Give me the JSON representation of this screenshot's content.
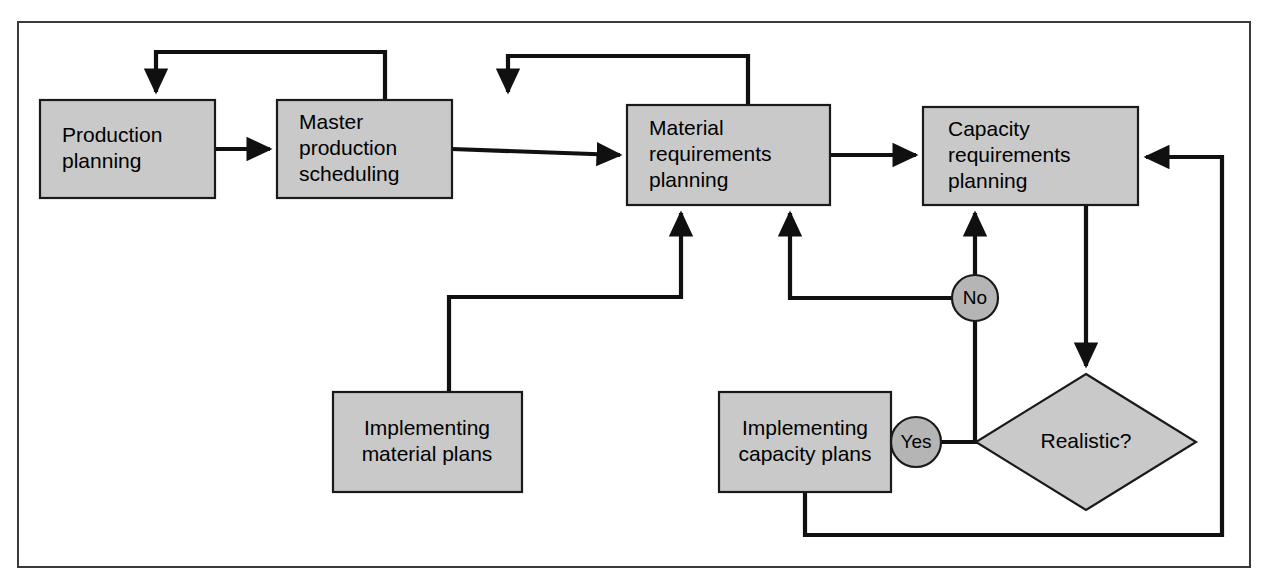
{
  "figure": {
    "frame": {
      "x": 18,
      "y": 22,
      "width": 1232,
      "height": 545
    },
    "colors": {
      "box_fill": "#c9c9c9",
      "connector_fill": "#b5b5b5",
      "line": "#101010",
      "box_stroke": "#1a1a1a",
      "frame_stroke": "#3a3a3a",
      "background": "#ffffff",
      "text": "#000000"
    }
  },
  "nodes": [
    {
      "id": "production-planning",
      "shape": "rect",
      "x": 40,
      "y": 100,
      "width": 175,
      "height": 98,
      "lines": [
        "Production",
        "planning"
      ],
      "text_x": 62,
      "text_anchor": "start"
    },
    {
      "id": "master-production-scheduling",
      "shape": "rect",
      "x": 277,
      "y": 100,
      "width": 175,
      "height": 98,
      "lines": [
        "Master",
        "production",
        "scheduling"
      ],
      "text_x": 299,
      "text_anchor": "start"
    },
    {
      "id": "material-requirements-planning",
      "shape": "rect",
      "x": 627,
      "y": 105,
      "width": 203,
      "height": 100,
      "lines": [
        "Material",
        "requirements",
        "planning"
      ],
      "text_x": 649,
      "text_anchor": "start"
    },
    {
      "id": "capacity-requirements-planning",
      "shape": "rect",
      "x": 923,
      "y": 107,
      "width": 215,
      "height": 98,
      "lines": [
        "Capacity",
        "requirements",
        "planning"
      ],
      "text_x": 948,
      "text_anchor": "start"
    },
    {
      "id": "implementing-material-plans",
      "shape": "rect",
      "x": 333,
      "y": 392,
      "width": 189,
      "height": 100,
      "lines": [
        "Implementing",
        "material plans"
      ],
      "text_x": 427,
      "text_anchor": "middle"
    },
    {
      "id": "implementing-capacity-plans",
      "shape": "rect",
      "x": 719,
      "y": 392,
      "width": 172,
      "height": 100,
      "lines": [
        "Implementing",
        "capacity plans"
      ],
      "text_x": 805,
      "text_anchor": "middle"
    }
  ],
  "decision": {
    "id": "realistic-decision",
    "label": "Realistic?",
    "cx": 1086,
    "cy": 442,
    "half_width": 110,
    "half_height": 68
  },
  "connectors": [
    {
      "id": "no-connector",
      "label": "No",
      "cx": 975,
      "cy": 298,
      "r": 23
    },
    {
      "id": "yes-connector",
      "label": "Yes",
      "cx": 916,
      "cy": 442,
      "r": 25
    }
  ],
  "edges": [
    {
      "id": "production-to-master",
      "from": "production-planning",
      "to": "master-production-scheduling",
      "points": "215,149 270,149",
      "arrow": true
    },
    {
      "id": "master-to-material",
      "from": "master-production-scheduling",
      "to": "material-requirements-planning",
      "points": "452,149 620,155",
      "arrow": true
    },
    {
      "id": "material-to-capacity",
      "from": "material-requirements-planning",
      "to": "capacity-requirements-planning",
      "points": "830,155 916,155",
      "arrow": true
    },
    {
      "id": "master-feedback-to-production",
      "from": "master-production-scheduling",
      "to": "production-planning",
      "points": "385,100 385,52 156,52 156,92",
      "arrow": true
    },
    {
      "id": "material-feedback-to-master",
      "from": "material-requirements-planning",
      "to": "master-production-scheduling",
      "points": "748,105 748,56 508,56 508,92",
      "arrow": true
    },
    {
      "id": "material-plans-to-material-requirements",
      "from": "implementing-material-plans",
      "to": "material-requirements-planning",
      "points": "449,392 449,297 681,297 681,213",
      "arrow": true
    },
    {
      "id": "no-to-material-requirements",
      "from": "no-connector",
      "to": "material-requirements-planning",
      "points": "952,298 790,298 790,213",
      "arrow": true
    },
    {
      "id": "no-to-capacity-requirements",
      "from": "no-connector",
      "to": "capacity-requirements-planning",
      "points": "975,275 975,213",
      "arrow": true
    },
    {
      "id": "decision-to-no",
      "from": "realistic-decision",
      "to": "no-connector",
      "points": "975,442 975,321",
      "arrow": false
    },
    {
      "id": "decision-to-yes",
      "from": "realistic-decision",
      "to": "yes-connector",
      "points": "1086,442 941,442",
      "arrow": false
    },
    {
      "id": "yes-to-capacity-plans",
      "from": "yes-connector",
      "to": "implementing-capacity-plans",
      "points": "891,442 898,442",
      "arrow": true
    },
    {
      "id": "capacity-to-decision",
      "from": "capacity-requirements-planning",
      "to": "realistic-decision",
      "points": "1086,205 1086,366",
      "arrow": true
    },
    {
      "id": "capacity-plans-return-to-capacity-requirements",
      "from": "implementing-capacity-plans",
      "to": "capacity-requirements-planning",
      "points": "805,492 805,535 1222,535 1222,157 1146,157",
      "arrow": true
    }
  ]
}
